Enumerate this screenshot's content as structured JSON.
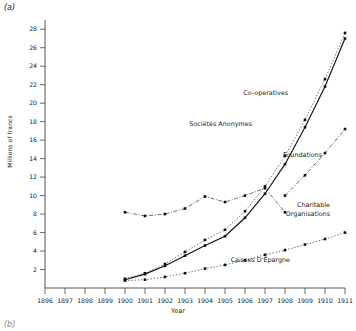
{
  "figure": {
    "panel_label": "(a)",
    "panel_label_next": "(b)"
  },
  "chart_data": {
    "type": "line",
    "title": "(a)",
    "xlabel": "Year",
    "ylabel": "Millions of francs",
    "xlim": [
      1896,
      1911
    ],
    "ylim": [
      0,
      29
    ],
    "ytick_labels": [
      "2",
      "4",
      "6",
      "8",
      "10",
      "12",
      "14",
      "16",
      "18",
      "20",
      "22",
      "24",
      "26",
      "28"
    ],
    "ytick_values": [
      2,
      4,
      6,
      8,
      10,
      12,
      14,
      16,
      18,
      20,
      22,
      24,
      26,
      28
    ],
    "xtick_labels": [
      "1896",
      "1897",
      "1898",
      "1899",
      "1900",
      "1901",
      "1902",
      "1903",
      "1904",
      "1905",
      "1906",
      "1907",
      "1908",
      "1909",
      "1910",
      "1911"
    ],
    "grid": false,
    "legend_position": "inline-annotations",
    "series": [
      {
        "name": "Co-operatives",
        "label": "Co-operatives",
        "style": "dotted-thin",
        "color": "#3a3a3a",
        "x": [
          1900,
          1901,
          1902,
          1903,
          1904,
          1905,
          1906,
          1907,
          1908,
          1909,
          1910,
          1911
        ],
        "values": [
          1.0,
          1.6,
          2.6,
          3.9,
          5.2,
          6.3,
          8.3,
          11.0,
          14.3,
          18.2,
          22.6,
          27.6
        ]
      },
      {
        "name": "Societes Anonymes",
        "label": "Sociétés Anonymes",
        "style": "solid",
        "color": "#111111",
        "x": [
          1900,
          1901,
          1902,
          1903,
          1904,
          1905,
          1906,
          1907,
          1908,
          1909,
          1910,
          1911
        ],
        "values": [
          0.9,
          1.5,
          2.4,
          3.5,
          4.6,
          5.6,
          7.6,
          10.2,
          13.4,
          17.4,
          21.8,
          27.0
        ]
      },
      {
        "name": "Foundations",
        "label": "Foundations",
        "style": "dash-dot",
        "color": "#3a3a3a",
        "x": [
          1908,
          1909,
          1910,
          1911
        ],
        "values": [
          10.0,
          12.2,
          14.6,
          17.2
        ]
      },
      {
        "name": "Charitable Organisations",
        "label": "Charitable Organisations",
        "style": "dash-dot",
        "color": "#3a3a3a",
        "x": [
          1900,
          1901,
          1902,
          1903,
          1904,
          1905,
          1906,
          1907,
          1908
        ],
        "values": [
          8.2,
          7.8,
          8.0,
          8.6,
          9.9,
          9.3,
          10.0,
          10.8,
          8.2
        ]
      },
      {
        "name": "Caisses D Epargne",
        "label": "Caisses D'Épargne",
        "style": "dotted-thin",
        "color": "#3a3a3a",
        "x": [
          1900,
          1901,
          1902,
          1903,
          1904,
          1905,
          1906,
          1907,
          1908,
          1909,
          1910,
          1911
        ],
        "values": [
          0.8,
          0.9,
          1.2,
          1.6,
          2.1,
          2.5,
          3.0,
          3.6,
          4.1,
          4.7,
          5.3,
          6.0
        ]
      }
    ],
    "annotations": [
      {
        "text": "Co-operatives",
        "x_px": 288,
        "y_px": 95
      },
      {
        "text": "Sociétés Anonymes",
        "x_px": 252,
        "y_px": 126
      },
      {
        "text": "Foundations",
        "x_px": 322,
        "y_px": 157
      },
      {
        "text": "Charitable",
        "x_px": 330,
        "y_px": 207
      },
      {
        "text": "Organisations",
        "x_px": 330,
        "y_px": 216
      },
      {
        "text": "Caisses D'Épargne",
        "x_px": 290,
        "y_px": 262
      }
    ]
  }
}
